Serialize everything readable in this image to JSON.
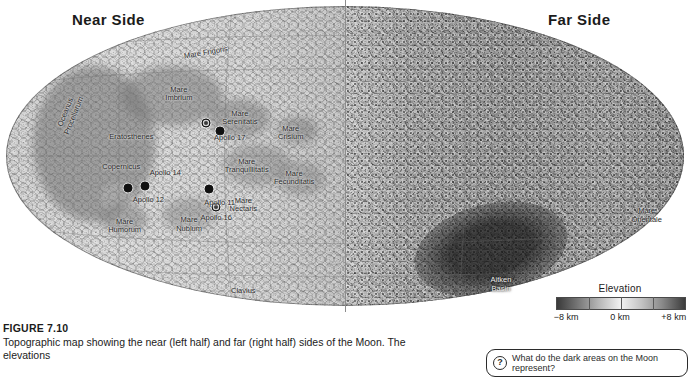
{
  "figure": {
    "number": "FIGURE 7.10",
    "caption": "Topographic map showing the near (left half) and far (right half) sides of the Moon. The elevations"
  },
  "headings": {
    "near_side": "Near Side",
    "far_side": "Far Side"
  },
  "legend": {
    "title": "Elevation",
    "min_label": "−8 km",
    "mid_label": "0 km",
    "max_label": "+8 km",
    "gradient_low_color": "#3a3a3a",
    "gradient_mid_color": "#f2f2f2",
    "gradient_high_color": "#3c3c3c"
  },
  "callout": {
    "icon": "question-mark-icon",
    "icon_glyph": "?",
    "text": "What do the dark areas on the Moon represent?"
  },
  "map": {
    "projection": "mollweide-ellipse",
    "near_side_features": [
      {
        "name": "Oceanus\nProcellarum",
        "x": 9.5,
        "y": 36.0,
        "rotated": true,
        "style": "dark"
      },
      {
        "name": "Mare Frigoris",
        "x": 29.5,
        "y": 15.5,
        "rotated": true,
        "style": "dark"
      },
      {
        "name": "Mare\nImbrium",
        "x": 25.5,
        "y": 29.5,
        "rotated": false,
        "style": "dark"
      },
      {
        "name": "Eratosthenes",
        "x": 18.5,
        "y": 43.5,
        "rotated": false,
        "style": "dark"
      },
      {
        "name": "Copernicus",
        "x": 17.0,
        "y": 53.5,
        "rotated": false,
        "style": "dark"
      },
      {
        "name": "Mare\nSerenitatis",
        "x": 34.5,
        "y": 37.5,
        "rotated": false,
        "style": "dark"
      },
      {
        "name": "Mare\nCrisium",
        "x": 42.0,
        "y": 42.5,
        "rotated": false,
        "style": "dark"
      },
      {
        "name": "Mare\nTranquillitatis",
        "x": 35.5,
        "y": 53.5,
        "rotated": false,
        "style": "dark"
      },
      {
        "name": "Mare\nFecunditatis",
        "x": 42.5,
        "y": 57.5,
        "rotated": false,
        "style": "dark"
      },
      {
        "name": "Mare\nNectaris",
        "x": 35.0,
        "y": 66.5,
        "rotated": false,
        "style": "dark"
      },
      {
        "name": "Mare\nHumorum",
        "x": 17.5,
        "y": 73.5,
        "rotated": false,
        "style": "dark"
      },
      {
        "name": "Mare\nNubium",
        "x": 27.0,
        "y": 73.0,
        "rotated": false,
        "style": "dark"
      },
      {
        "name": "Clavius",
        "x": 35.0,
        "y": 95.0,
        "rotated": false,
        "style": "dark"
      }
    ],
    "landing_sites": [
      {
        "name": "Apollo 17",
        "x": 29.5,
        "y": 39.0,
        "label_x": 33.0,
        "label_y": 44.0
      },
      {
        "name": "Apollo 15",
        "x": 31.5,
        "y": 41.5,
        "label_x": 0,
        "label_y": 0
      },
      {
        "name": "Apollo 14",
        "x": 20.5,
        "y": 60.0,
        "label_x": 23.5,
        "label_y": 55.5
      },
      {
        "name": "Apollo 12",
        "x": 18.0,
        "y": 60.5,
        "label_x": 21.0,
        "label_y": 64.5
      },
      {
        "name": "Apollo 11",
        "x": 30.0,
        "y": 61.0,
        "label_x": 31.5,
        "label_y": 65.5
      },
      {
        "name": "Apollo 16",
        "x": 31.0,
        "y": 67.0,
        "label_x": 31.0,
        "label_y": 70.5
      }
    ],
    "far_side_features": [
      {
        "name": "Mare\nOrientale",
        "x": 94.5,
        "y": 70.0,
        "rotated": false,
        "style": "dark"
      },
      {
        "name": "Aitken\nBasin",
        "x": 73.0,
        "y": 93.0,
        "rotated": false,
        "style": "light"
      }
    ]
  }
}
